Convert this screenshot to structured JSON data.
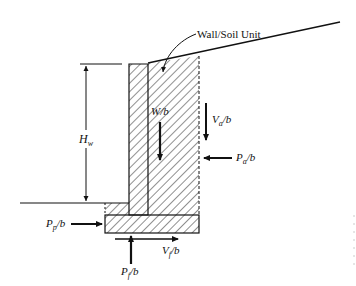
{
  "figure": {
    "callout_label": "Wall/Soil Unit",
    "labels": {
      "height": {
        "main": "H",
        "sub": "w",
        "suffix": ""
      },
      "weight": {
        "main": "W/b",
        "sub": "",
        "suffix": ""
      },
      "active_vertical": {
        "main": "V",
        "sub": "a",
        "suffix": "/b"
      },
      "active_horizontal": {
        "main": "P",
        "sub": "a",
        "suffix": "/b"
      },
      "passive": {
        "main": "P",
        "sub": "p",
        "suffix": "/b"
      },
      "base_shear": {
        "main": "V",
        "sub": "f",
        "suffix": "/b"
      },
      "base_normal": {
        "main": "P",
        "sub": "f",
        "suffix": "/b"
      }
    },
    "colors": {
      "line": "#111111",
      "hatch": "#222222",
      "background": "#ffffff"
    }
  }
}
